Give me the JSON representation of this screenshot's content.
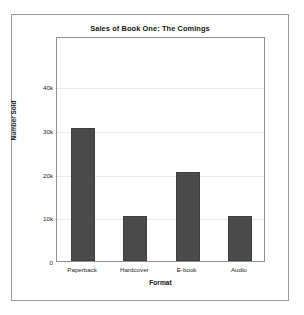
{
  "chart_data": {
    "type": "bar",
    "title": "Sales of Book One: The Comings",
    "xlabel": "Format",
    "ylabel": "Number Sold",
    "categories": [
      "Paperback",
      "Hardcover",
      "E-book",
      "Audio"
    ],
    "values": [
      30400,
      10300,
      20400,
      10400
    ],
    "ytick_values": [
      0,
      10000,
      20000,
      30000,
      40000
    ],
    "ytick_labels": [
      "0",
      "10k",
      "20k",
      "30k",
      "40k"
    ],
    "ylim": [
      0,
      51500
    ],
    "grid": true,
    "legend": null,
    "bar_color": "#4a4a4a",
    "bar_edge_color": "#3f3f3f",
    "gridline_color": "#e9e9e9",
    "axes_color": "#8f8f8f",
    "background_color": "#ffffff",
    "frame_color": "#9a9a9a"
  }
}
